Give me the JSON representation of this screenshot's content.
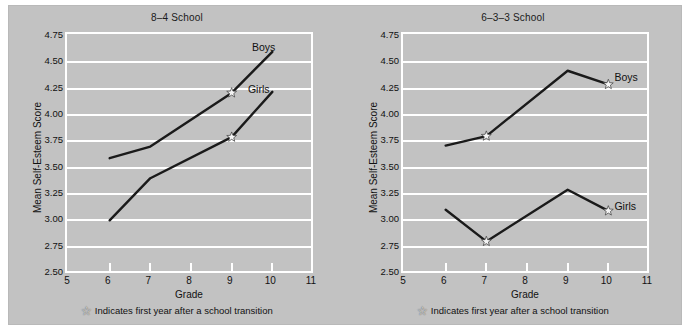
{
  "figure": {
    "background_color": "#c2c2c2",
    "outer_background_color": "#ffffff",
    "grid_color": "#ffffff",
    "line_color": "#1a1a1a",
    "text_color": "#111111"
  },
  "caption": {
    "star_glyph": "☆",
    "text": "Indicates first year after a school transition"
  },
  "axis": {
    "xlabel": "Grade",
    "ylabel": "Mean Self-Esteem Score",
    "xticks": [
      "5",
      "6",
      "7",
      "8",
      "9",
      "10",
      "11"
    ],
    "yticks": [
      "2.50",
      "2.75",
      "3.00",
      "3.25",
      "3.50",
      "3.75",
      "4.00",
      "4.25",
      "4.50",
      "4.75"
    ],
    "xlim": [
      5,
      11
    ],
    "ylim": [
      2.5,
      4.75
    ]
  },
  "chart_data": [
    {
      "type": "line",
      "title": "8–4 School",
      "xlabel": "Grade",
      "ylabel": "Mean Self-Esteem Score",
      "xlim": [
        5,
        11
      ],
      "ylim": [
        2.5,
        4.75
      ],
      "xticks": [
        5,
        6,
        7,
        8,
        9,
        10,
        11
      ],
      "yticks": [
        2.5,
        2.75,
        3.0,
        3.25,
        3.5,
        3.75,
        4.0,
        4.25,
        4.5,
        4.75
      ],
      "grid": "horizontal",
      "legend": "inline-labels",
      "series": [
        {
          "name": "Boys",
          "x": [
            6,
            7,
            9,
            10
          ],
          "values": [
            3.59,
            3.7,
            4.21,
            4.6
          ],
          "transition_markers": [
            9
          ],
          "label_x": 9.55,
          "label_y": 4.62
        },
        {
          "name": "Girls",
          "x": [
            6,
            7,
            9,
            10
          ],
          "values": [
            3.0,
            3.4,
            3.79,
            4.22
          ],
          "transition_markers": [
            9
          ],
          "label_x": 9.45,
          "label_y": 4.22
        }
      ]
    },
    {
      "type": "line",
      "title": "6–3–3 School",
      "xlabel": "Grade",
      "ylabel": "Mean Self-Esteem Score",
      "xlim": [
        5,
        11
      ],
      "ylim": [
        2.5,
        4.75
      ],
      "xticks": [
        5,
        6,
        7,
        8,
        9,
        10,
        11
      ],
      "yticks": [
        2.5,
        2.75,
        3.0,
        3.25,
        3.5,
        3.75,
        4.0,
        4.25,
        4.5,
        4.75
      ],
      "grid": "horizontal",
      "legend": "inline-labels",
      "series": [
        {
          "name": "Boys",
          "x": [
            6,
            7,
            9,
            10
          ],
          "values": [
            3.71,
            3.8,
            4.42,
            4.29
          ],
          "transition_markers": [
            7,
            10
          ],
          "label_x": 10.2,
          "label_y": 4.33
        },
        {
          "name": "Girls",
          "x": [
            6,
            7,
            9,
            10
          ],
          "values": [
            3.1,
            2.8,
            3.29,
            3.09
          ],
          "transition_markers": [
            7,
            10
          ],
          "label_x": 10.2,
          "label_y": 3.11
        }
      ]
    }
  ]
}
